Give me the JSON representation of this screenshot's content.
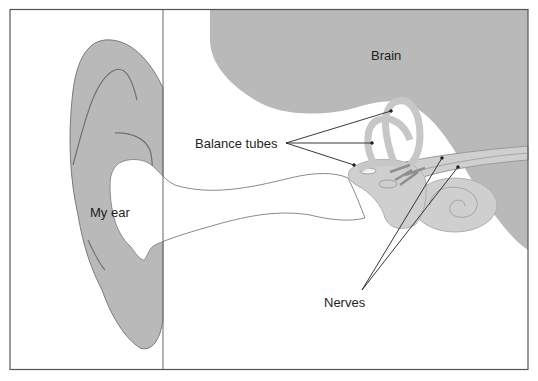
{
  "diagram": {
    "type": "anatomy-illustration",
    "subject": "ear",
    "labels": {
      "brain": "Brain",
      "balance_tubes": "Balance tubes",
      "my_ear": "My ear",
      "nerves": "Nerves"
    },
    "colors": {
      "tissue_fill": "#b9b9b9",
      "inner_ear_fill": "#cfcfcf",
      "outline": "#7a7a7a",
      "frame": "#555555",
      "leader_line": "#222222",
      "background": "#ffffff"
    }
  }
}
